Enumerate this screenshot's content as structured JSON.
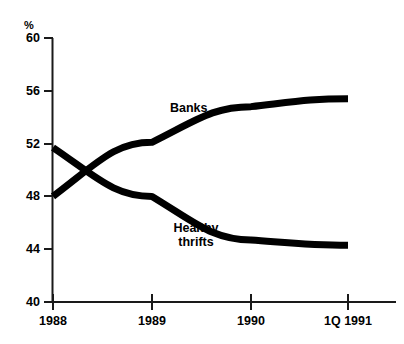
{
  "chart_data": {
    "type": "line",
    "title": "",
    "subtitle": "",
    "xlabel": "",
    "ylabel": "",
    "yunit": "%",
    "x": [
      "1988",
      "1989",
      "1990",
      "1Q 1991"
    ],
    "categories": [
      "1988",
      "1989",
      "1990",
      "1Q 1991"
    ],
    "xtick_labels": [
      "1988",
      "1989",
      "1990",
      "1Q 1991"
    ],
    "ytick_labels": [
      "60",
      "56",
      "52",
      "48",
      "44",
      "40"
    ],
    "ytick_values": [
      60,
      56,
      52,
      48,
      44,
      40
    ],
    "ylim": [
      40,
      60
    ],
    "grid": false,
    "legend_position": "inline-annotations",
    "series": [
      {
        "name": "Banks",
        "label": "Banks",
        "values": [
          48.0,
          52.1,
          54.8,
          55.4
        ],
        "color": "#000000"
      },
      {
        "name": "Healthy thrifts",
        "label_line1": "Healthy",
        "label_line2": "thrifts",
        "values": [
          51.7,
          48.0,
          44.7,
          44.3
        ],
        "color": "#000000"
      }
    ],
    "annotations": [
      {
        "text": "Banks",
        "x": "1989",
        "y": 54.0
      },
      {
        "text": "Healthy thrifts",
        "x": "1989",
        "y": 46.0
      }
    ]
  },
  "axis": {
    "unit_symbol": "%",
    "y_ticks": [
      {
        "label": "60",
        "value": 60
      },
      {
        "label": "56",
        "value": 56
      },
      {
        "label": "52",
        "value": 52
      },
      {
        "label": "48",
        "value": 48
      },
      {
        "label": "44",
        "value": 44
      },
      {
        "label": "40",
        "value": 40
      }
    ],
    "x_ticks": [
      {
        "label": "1988",
        "value": 0
      },
      {
        "label": "1989",
        "value": 1
      },
      {
        "label": "1990",
        "value": 2
      },
      {
        "label": "1Q 1991",
        "value": 3
      }
    ]
  },
  "labels": {
    "banks": "Banks",
    "thrifts_line1": "Healthy",
    "thrifts_line2": "thrifts"
  },
  "colors": {
    "line": "#000000",
    "axis": "#1a1a1a",
    "background": "#ffffff"
  }
}
